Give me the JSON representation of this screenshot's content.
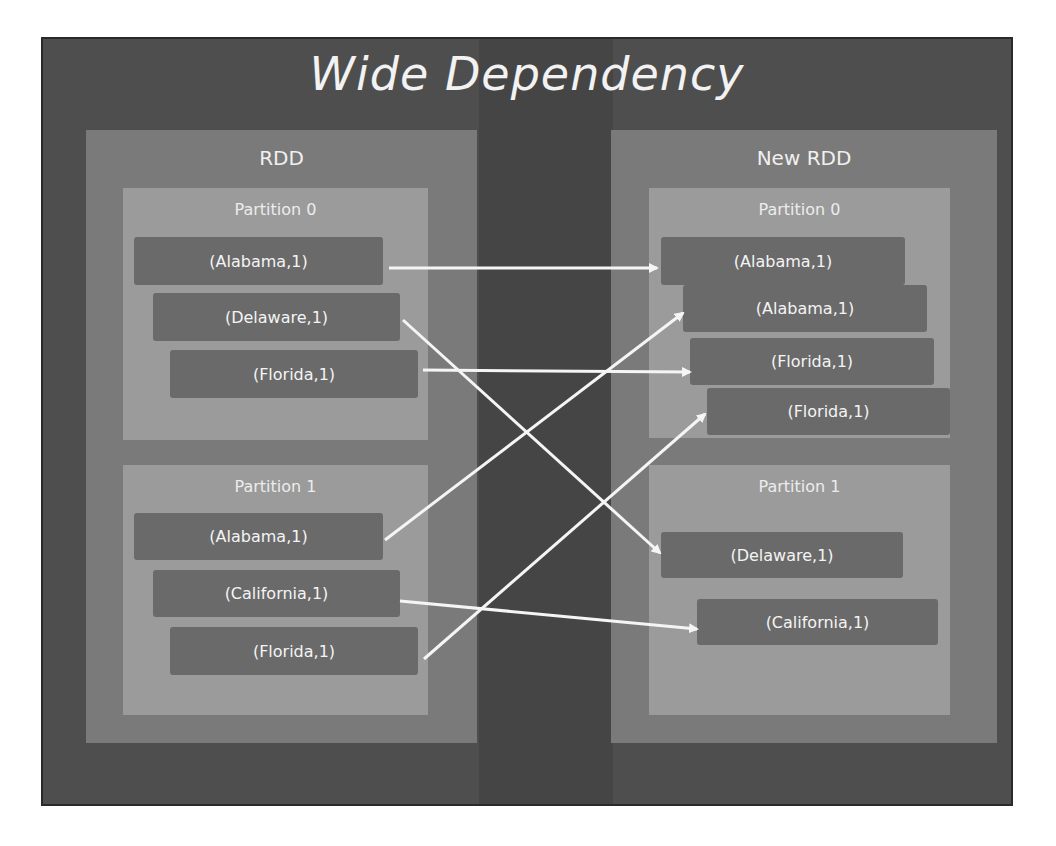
{
  "title": "Wide Dependency",
  "colors": {
    "frame_bg": "#4e4e4e",
    "panel_bg": "#7a7a7a",
    "partition_bg": "#9b9b9b",
    "record_bg": "#6a6a6a",
    "text": "#f2f2f2",
    "arrow": "#f5f5f5"
  },
  "source_rdd": {
    "label": "RDD",
    "partitions": [
      {
        "label": "Partition 0",
        "records": [
          "(Alabama,1)",
          "(Delaware,1)",
          "(Florida,1)"
        ]
      },
      {
        "label": "Partition 1",
        "records": [
          "(Alabama,1)",
          "(California,1)",
          "(Florida,1)"
        ]
      }
    ]
  },
  "target_rdd": {
    "label": "New RDD",
    "partitions": [
      {
        "label": "Partition 0",
        "records": [
          "(Alabama,1)",
          "(Alabama,1)",
          "(Florida,1)",
          "(Florida,1)"
        ]
      },
      {
        "label": "Partition 1",
        "records": [
          "(Delaware,1)",
          "(California,1)"
        ]
      }
    ]
  },
  "edges": [
    {
      "from": "RDD/Partition 0/(Alabama,1)",
      "to": "New RDD/Partition 0/(Alabama,1)#1"
    },
    {
      "from": "RDD/Partition 0/(Delaware,1)",
      "to": "New RDD/Partition 1/(Delaware,1)"
    },
    {
      "from": "RDD/Partition 0/(Florida,1)",
      "to": "New RDD/Partition 0/(Florida,1)#1"
    },
    {
      "from": "RDD/Partition 1/(Alabama,1)",
      "to": "New RDD/Partition 0/(Alabama,1)#2"
    },
    {
      "from": "RDD/Partition 1/(California,1)",
      "to": "New RDD/Partition 1/(California,1)"
    },
    {
      "from": "RDD/Partition 1/(Florida,1)",
      "to": "New RDD/Partition 0/(Florida,1)#2"
    }
  ]
}
